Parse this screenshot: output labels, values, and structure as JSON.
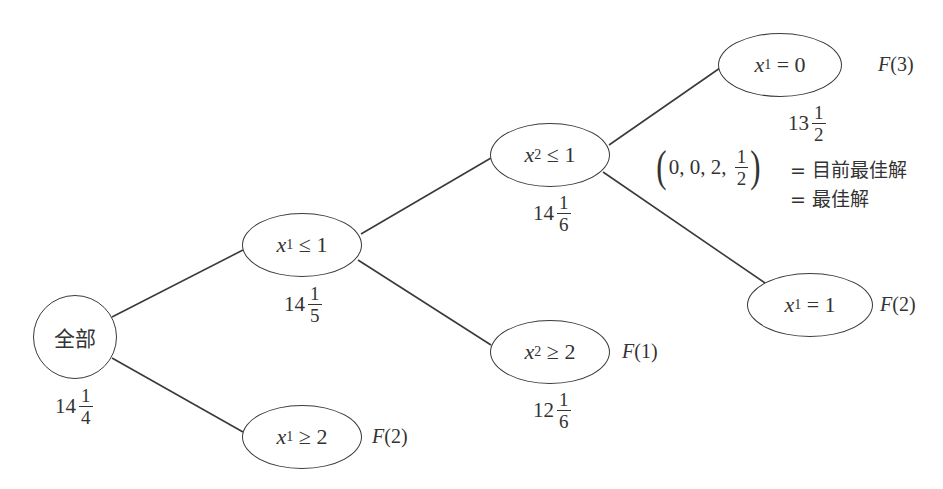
{
  "diagram": {
    "type": "branch-and-bound-tree",
    "nodes": [
      {
        "id": "root",
        "label": "全部",
        "bound_whole": "14",
        "bound_num": "1",
        "bound_den": "4"
      },
      {
        "id": "x1_le_1",
        "var": "x",
        "sub": "1",
        "rel": " ≤ 1",
        "bound_whole": "14",
        "bound_num": "1",
        "bound_den": "5"
      },
      {
        "id": "x1_ge_2",
        "var": "x",
        "sub": "1",
        "rel": " ≥ 2",
        "tag_prefix": "F",
        "tag_value": "(2)"
      },
      {
        "id": "x2_le_1",
        "var": "x",
        "sub": "2",
        "rel": " ≤ 1",
        "bound_whole": "14",
        "bound_num": "1",
        "bound_den": "6"
      },
      {
        "id": "x2_ge_2",
        "var": "x",
        "sub": "2",
        "rel": " ≥ 2",
        "tag_prefix": "F",
        "tag_value": "(1)",
        "bound_whole": "12",
        "bound_num": "1",
        "bound_den": "6"
      },
      {
        "id": "x1_eq_0",
        "var": "x",
        "sub": "1",
        "rel": " = 0",
        "tag_prefix": "F",
        "tag_value": "(3)",
        "bound_whole": "13",
        "bound_num": "1",
        "bound_den": "2"
      },
      {
        "id": "x1_eq_1",
        "var": "x",
        "sub": "1",
        "rel": " = 1",
        "tag_prefix": "F",
        "tag_value": "(2)"
      }
    ],
    "edges": [
      [
        "root",
        "x1_le_1"
      ],
      [
        "root",
        "x1_ge_2"
      ],
      [
        "x1_le_1",
        "x2_le_1"
      ],
      [
        "x1_le_1",
        "x2_ge_2"
      ],
      [
        "x2_le_1",
        "x1_eq_0"
      ],
      [
        "x2_le_1",
        "x1_eq_1"
      ]
    ],
    "solution": {
      "vector_prefix": "0, 0, 2, ",
      "frac_num": "1",
      "frac_den": "2",
      "line1": "= 目前最佳解",
      "line2": "= 最佳解"
    }
  }
}
